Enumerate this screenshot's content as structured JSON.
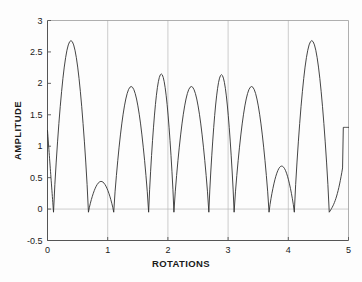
{
  "chart_data": {
    "type": "line",
    "title": "",
    "xlabel": "ROTATIONS",
    "ylabel": "AMPLITUDE",
    "xlim": [
      0,
      5
    ],
    "ylim": [
      -0.5,
      3
    ],
    "xticks": [
      0,
      1,
      2,
      3,
      4,
      5
    ],
    "xtick_labels": [
      "0",
      "1",
      "2",
      "3",
      "4",
      "5"
    ],
    "yticks": [
      -0.5,
      0,
      0.5,
      1,
      1.5,
      2,
      2.5,
      3
    ],
    "ytick_labels": [
      "-0.5",
      "0",
      "0.5",
      "1",
      "1.5",
      "2",
      "2.5",
      "3"
    ],
    "grid": "vertical gridlines at x=1,2,3,4 and horizontal gridline at y=0",
    "legend": "none",
    "line_color": "#303030",
    "series": [
      {
        "name": "amplitude",
        "description": "Rectified beating waveform; alternating large and small lobes, one large plus one small lobe per rotation",
        "large_peak_value": 2.68,
        "small_peak_value": 1.95,
        "minimum_value": -0.05,
        "value_at_x0": 1.25,
        "value_at_x5": 1.3,
        "large_peak_x": [
          0.45,
          1.45,
          2.45,
          3.45,
          4.45
        ],
        "small_peak_x": [
          0.93,
          1.92,
          2.92,
          3.92,
          4.9
        ],
        "zero_x": [
          0.1,
          0.68,
          1.1,
          1.68,
          2.1,
          2.68,
          3.1,
          3.68,
          4.1,
          4.68
        ],
        "x": [
          0.0,
          0.05,
          0.1,
          0.15,
          0.2,
          0.25,
          0.3,
          0.35,
          0.4,
          0.45,
          0.5,
          0.55,
          0.6,
          0.65,
          0.7,
          0.75,
          0.8,
          0.85,
          0.9,
          0.95,
          1.0,
          1.05,
          1.1,
          1.15,
          1.2,
          1.25,
          1.3,
          1.35,
          1.4,
          1.45,
          1.5,
          1.55,
          1.6,
          1.65,
          1.7,
          1.75,
          1.8,
          1.85,
          1.9,
          1.95,
          2.0,
          2.05,
          2.1,
          2.15,
          2.2,
          2.25,
          2.3,
          2.35,
          2.4,
          2.45,
          2.5,
          2.55,
          2.6,
          2.65,
          2.7,
          2.75,
          2.8,
          2.85,
          2.9,
          2.95,
          3.0,
          3.05,
          3.1,
          3.15,
          3.2,
          3.25,
          3.3,
          3.35,
          3.4,
          3.45,
          3.5,
          3.55,
          3.6,
          3.65,
          3.7,
          3.75,
          3.8,
          3.85,
          3.9,
          3.95,
          4.0,
          4.05,
          4.1,
          4.15,
          4.2,
          4.25,
          4.3,
          4.35,
          4.4,
          4.45,
          4.5,
          4.55,
          4.6,
          4.65,
          4.7,
          4.75,
          4.8,
          4.85,
          4.9,
          4.95,
          5.0
        ],
        "values": [
          1.25,
          0.62,
          0.0,
          0.62,
          1.22,
          1.78,
          2.25,
          2.55,
          2.68,
          2.68,
          2.6,
          2.4,
          2.1,
          1.72,
          1.25,
          0.72,
          0.18,
          0.0,
          0.55,
          1.1,
          1.6,
          1.88,
          1.95,
          1.84,
          1.56,
          1.12,
          0.6,
          0.1,
          0.0,
          0.6,
          1.2,
          1.77,
          2.24,
          2.54,
          2.67,
          2.67,
          2.59,
          2.39,
          2.09,
          1.71,
          1.24,
          0.71,
          0.17,
          0.0,
          0.56,
          1.11,
          1.59,
          1.87,
          1.95,
          1.83,
          1.55,
          1.11,
          0.59,
          0.09,
          0.0,
          0.61,
          1.21,
          1.77,
          2.23,
          2.53,
          2.66,
          2.66,
          2.58,
          2.38,
          2.08,
          1.7,
          1.23,
          0.7,
          0.16,
          0.0,
          0.57,
          1.12,
          1.6,
          1.88,
          1.95,
          1.82,
          1.54,
          1.1,
          0.58,
          0.08,
          0.0,
          0.62,
          1.22,
          1.78,
          2.24,
          2.54,
          2.66,
          2.65,
          2.57,
          2.37,
          2.07,
          1.69,
          1.22,
          0.69,
          0.15,
          0.0,
          0.58,
          1.13,
          1.61,
          1.88,
          1.94
        ]
      }
    ]
  },
  "axes": {
    "y_title": "AMPLITUDE",
    "x_title": "ROTATIONS"
  }
}
